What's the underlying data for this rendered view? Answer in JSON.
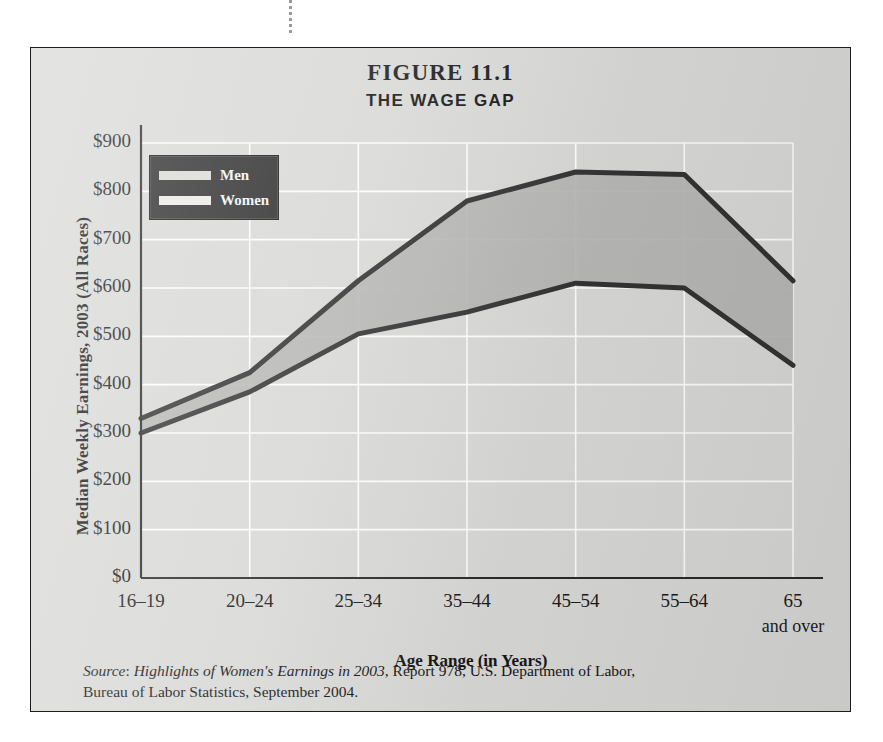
{
  "figure": {
    "title": "FIGURE 11.1",
    "subtitle": "THE WAGE GAP"
  },
  "legend": {
    "position": "top-left",
    "items": [
      {
        "label": "Men",
        "color": "#d9d9d6"
      },
      {
        "label": "Women",
        "color": "#eceae6"
      }
    ],
    "box_color": "#2b2b2b"
  },
  "source": {
    "prefix": "Source",
    "title_italic": "Highlights of Women's Earnings in 2003",
    "rest": ", Report 978, U.S. Department of Labor,",
    "line2": "Bureau of Labor Statistics, September 2004."
  },
  "colors": {
    "plot_background": "#d8d8d6",
    "area_fill": "#b4b4b2",
    "line": "#333333",
    "gridline": "#ffffff",
    "frame": "#1d1d1d",
    "text": "#151515"
  },
  "chart_data": {
    "type": "line",
    "title": "THE WAGE GAP",
    "subtitle": "FIGURE 11.1",
    "xlabel": "Age Range (in Years)",
    "ylabel": "Median Weekly Earnings, 2003 (All Races)",
    "categories": [
      "16–19",
      "20–24",
      "25–34",
      "35–44",
      "45–54",
      "55–64",
      "65"
    ],
    "category_sublabels": [
      "",
      "",
      "",
      "",
      "",
      "",
      "and over"
    ],
    "ylim": [
      0,
      900
    ],
    "ytick_values": [
      0,
      100,
      200,
      300,
      400,
      500,
      600,
      700,
      800,
      900
    ],
    "ytick_labels": [
      "$0",
      "$100",
      "$200",
      "$300",
      "$400",
      "$500",
      "$600",
      "$700",
      "$800",
      "$900"
    ],
    "grid": "horizontal-and-vertical",
    "legend_position": "upper-left",
    "fill_between_series": true,
    "series": [
      {
        "name": "Men",
        "values": [
          330,
          425,
          615,
          780,
          840,
          835,
          615
        ]
      },
      {
        "name": "Women",
        "values": [
          300,
          385,
          505,
          550,
          610,
          600,
          440
        ]
      }
    ]
  }
}
